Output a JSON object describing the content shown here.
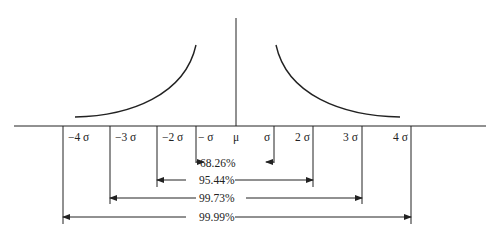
{
  "diagram": {
    "title": "",
    "sigma_labels": [
      {
        "text": "−4 σ",
        "x": 68
      },
      {
        "text": "−3 σ",
        "x": 115
      },
      {
        "text": "−2 σ",
        "x": 162
      },
      {
        "text": "− σ",
        "x": 198
      },
      {
        "text": "μ",
        "x": 233
      },
      {
        "text": "σ",
        "x": 264
      },
      {
        "text": "2 σ",
        "x": 295
      },
      {
        "text": "3 σ",
        "x": 343
      },
      {
        "text": "4 σ",
        "x": 393
      }
    ],
    "intervals": [
      {
        "range": "±1σ",
        "label": "68.26%"
      },
      {
        "range": "±2σ",
        "label": "95.44%"
      },
      {
        "range": "±3σ",
        "label": "99.73%"
      },
      {
        "range": "±4σ",
        "label": "99.99%"
      }
    ]
  }
}
